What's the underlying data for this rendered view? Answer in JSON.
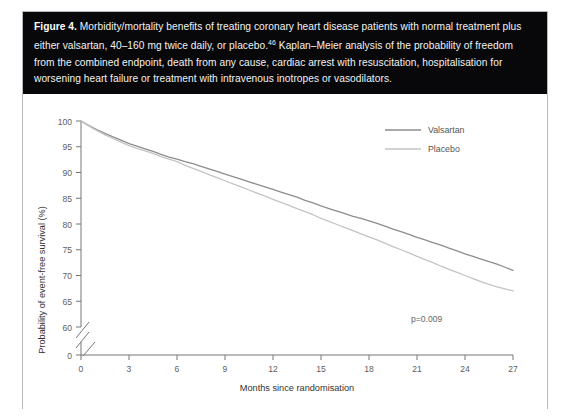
{
  "figure": {
    "label": "Figure 4.",
    "caption": " Morbidity/mortality benefits of treating coronary heart disease patients with normal treatment plus either valsartan, 40–160 mg twice daily, or placebo.",
    "caption_ref": "46",
    "caption_rest": " Kaplan–Meier analysis of the probability of freedom from the combined endpoint, death from any cause, cardiac arrest with resuscitation, hospitalisation for worsening heart failure or treatment with intravenous inotropes or vasodilators.",
    "caption_bg": "#08080a",
    "caption_fg": "#f2f2f2",
    "frame_color": "#b9b9b9"
  },
  "chart_data": {
    "type": "line",
    "title": "",
    "xlabel": "Months since randomisation",
    "ylabel": "Probability of event-free survival (%)",
    "xlim": [
      0,
      27
    ],
    "ylim": [
      60,
      100
    ],
    "y_axis_break": true,
    "y_break_from": 60,
    "y_break_to": 0,
    "grid": false,
    "legend_position": "top-right",
    "annotation": "p=0.009",
    "xticks": [
      "0",
      "3",
      "6",
      "9",
      "12",
      "15",
      "18",
      "21",
      "24",
      "27"
    ],
    "xtick_values": [
      0,
      3,
      6,
      9,
      12,
      15,
      18,
      21,
      24,
      27
    ],
    "yticks": [
      "100",
      "95",
      "90",
      "85",
      "80",
      "75",
      "70",
      "65",
      "60",
      "0"
    ],
    "ytick_values": [
      100,
      95,
      90,
      85,
      80,
      75,
      70,
      65,
      60,
      0
    ],
    "x": [
      0,
      0.5,
      1,
      1.5,
      2,
      2.5,
      3,
      3.5,
      4,
      4.5,
      5,
      5.5,
      6,
      6.5,
      7,
      7.5,
      8,
      8.5,
      9,
      9.5,
      10,
      10.5,
      11,
      11.5,
      12,
      12.5,
      13,
      13.5,
      14,
      14.5,
      15,
      15.5,
      16,
      16.5,
      17,
      17.5,
      18,
      18.5,
      19,
      19.5,
      20,
      20.5,
      21,
      21.5,
      22,
      22.5,
      23,
      23.5,
      24,
      24.5,
      25,
      25.5,
      26,
      26.5,
      27
    ],
    "series": [
      {
        "name": "Valsartan",
        "color": "#8d8d8d",
        "values": [
          100,
          99.1,
          98.3,
          97.6,
          96.9,
          96.3,
          95.6,
          95.1,
          94.6,
          94.1,
          93.5,
          93.0,
          92.6,
          92.1,
          91.7,
          91.2,
          90.7,
          90.2,
          89.7,
          89.2,
          88.7,
          88.2,
          87.7,
          87.2,
          86.7,
          86.2,
          85.7,
          85.2,
          84.6,
          84.1,
          83.5,
          83.0,
          82.5,
          82.0,
          81.5,
          81.1,
          80.6,
          80.1,
          79.6,
          79.0,
          78.5,
          78.0,
          77.4,
          76.9,
          76.4,
          75.9,
          75.3,
          74.8,
          74.2,
          73.7,
          73.2,
          72.7,
          72.2,
          71.6,
          71.0
        ]
      },
      {
        "name": "Placebo",
        "color": "#c4c4c4",
        "values": [
          100,
          99.0,
          98.1,
          97.3,
          96.6,
          95.9,
          95.2,
          94.7,
          94.2,
          93.7,
          93.1,
          92.6,
          92.1,
          91.4,
          90.8,
          90.2,
          89.6,
          89.0,
          88.4,
          87.8,
          87.2,
          86.6,
          86.0,
          85.4,
          84.8,
          84.2,
          83.6,
          83.0,
          82.4,
          81.8,
          81.1,
          80.5,
          79.9,
          79.3,
          78.7,
          78.1,
          77.5,
          76.9,
          76.3,
          75.6,
          75.0,
          74.4,
          73.7,
          73.1,
          72.5,
          71.8,
          71.2,
          70.6,
          70.0,
          69.4,
          68.8,
          68.3,
          67.8,
          67.4,
          67.0
        ]
      }
    ]
  }
}
